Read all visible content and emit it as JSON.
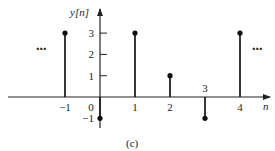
{
  "chart_data": {
    "type": "stem",
    "title": "",
    "caption": "(c)",
    "xlabel": "n",
    "ylabel": "y[n]",
    "x": [
      -1,
      0,
      1,
      2,
      3,
      4
    ],
    "values": [
      3,
      -1,
      3,
      1,
      -1,
      3
    ],
    "x_ticks": [
      "-1",
      "0",
      "1",
      "2",
      "3",
      "4"
    ],
    "y_ticks": [
      "3",
      "2",
      "1",
      "-1"
    ],
    "xlim": [
      -3,
      5
    ],
    "ylim": [
      -1.5,
      4
    ],
    "grid": false,
    "legend": null,
    "annotations": [
      "...",
      "..."
    ],
    "continuation_left": "...",
    "continuation_right": "..."
  }
}
